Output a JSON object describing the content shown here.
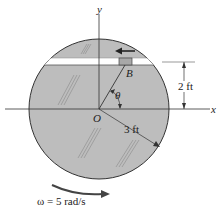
{
  "diagram": {
    "labels": {
      "y_axis": "y",
      "x_axis": "x",
      "origin": "O",
      "point_b": "B",
      "angle": "θ",
      "height": "2 ft",
      "radius": "3 ft",
      "omega": "ω = 5 rad/s"
    },
    "colors": {
      "disk_fill": "#bdbdbd",
      "line": "#333333",
      "block_fill": "#a8a8a8"
    }
  }
}
